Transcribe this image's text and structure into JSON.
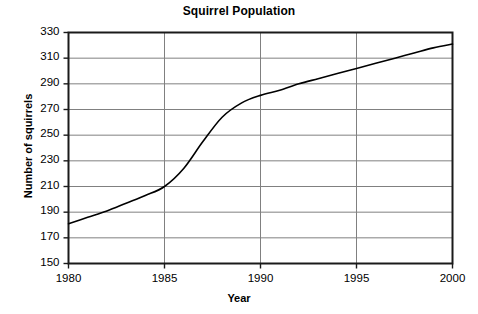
{
  "chart_data": {
    "type": "line",
    "title": "Squirrel Population",
    "xlabel": "Year",
    "ylabel": "Number of squirrels",
    "x": [
      1980,
      1981,
      1982,
      1983,
      1984,
      1985,
      1986,
      1987,
      1988,
      1989,
      1990,
      1991,
      1992,
      1993,
      1994,
      1995,
      1996,
      1997,
      1998,
      1999,
      2000
    ],
    "values": [
      181,
      186,
      191,
      197,
      203,
      210,
      224,
      245,
      264,
      275,
      281,
      285,
      290,
      294,
      298,
      302,
      306,
      310,
      314,
      318,
      321
    ],
    "series": [
      {
        "name": "Number of squirrels",
        "values": [
          181,
          186,
          191,
          197,
          203,
          210,
          224,
          245,
          264,
          275,
          281,
          285,
          290,
          294,
          298,
          302,
          306,
          310,
          314,
          318,
          321
        ]
      }
    ],
    "xlim": [
      1980,
      2000
    ],
    "ylim": [
      150,
      330
    ],
    "xticks": [
      1980,
      1985,
      1990,
      1995,
      2000
    ],
    "xtick_labels": [
      "1980",
      "1985",
      "1990",
      "1995",
      "2000"
    ],
    "yticks": [
      150,
      170,
      190,
      210,
      230,
      250,
      270,
      290,
      310,
      330
    ],
    "ytick_labels": [
      "150",
      "170",
      "190",
      "210",
      "230",
      "250",
      "270",
      "290",
      "310",
      "330"
    ],
    "grid": "horizontal-and-vertical",
    "legend": "none",
    "line_color": "#000000",
    "grid_color": "#808080",
    "axis_color": "#1a1a1a",
    "background_color": "#ffffff"
  }
}
